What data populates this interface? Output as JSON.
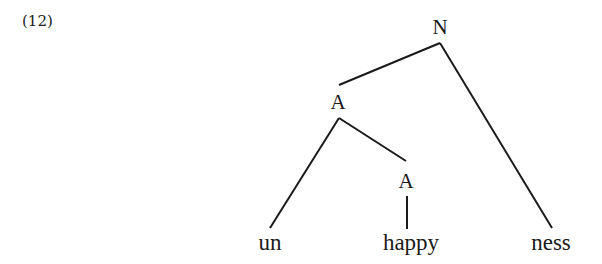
{
  "example": {
    "number": "(12)"
  },
  "tree": {
    "nodes": {
      "root": "N",
      "upper_adjective": "A",
      "lower_adjective": "A"
    },
    "leaves": {
      "prefix": "un",
      "stem": "happy",
      "suffix": "ness"
    }
  }
}
